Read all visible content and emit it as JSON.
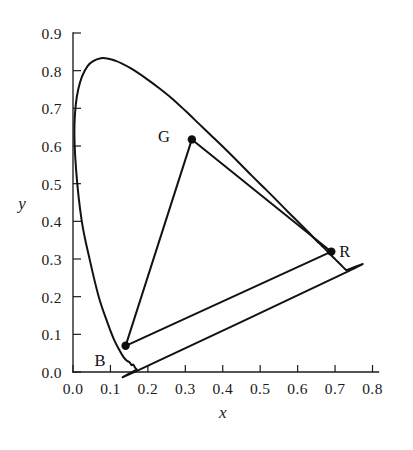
{
  "chart_data": {
    "type": "scatter",
    "title": "",
    "subtitle": "",
    "xlabel": "x",
    "ylabel": "y",
    "xlim": [
      0.0,
      0.8
    ],
    "ylim": [
      0.0,
      0.9
    ],
    "grid": false,
    "legend": "none",
    "x_ticks": [
      "0.0",
      "0.1",
      "0.2",
      "0.3",
      "0.4",
      "0.5",
      "0.6",
      "0.7",
      "0.8"
    ],
    "y_ticks": [
      "0.0",
      "0.1",
      "0.2",
      "0.3",
      "0.4",
      "0.5",
      "0.6",
      "0.7",
      "0.8",
      "0.9"
    ],
    "x_tick_values": [
      0.0,
      0.1,
      0.2,
      0.3,
      0.4,
      0.5,
      0.6,
      0.7,
      0.8
    ],
    "y_tick_values": [
      0.0,
      0.1,
      0.2,
      0.3,
      0.4,
      0.5,
      0.6,
      0.7,
      0.8,
      0.9
    ],
    "series": [
      {
        "name": "spectral-locus",
        "type": "line",
        "closed": true,
        "points": [
          [
            0.175,
            0.005
          ],
          [
            0.17,
            0.007
          ],
          [
            0.1655,
            0.012
          ],
          [
            0.161,
            0.02
          ],
          [
            0.1566,
            0.018
          ],
          [
            0.151,
            0.026
          ],
          [
            0.144,
            0.03
          ],
          [
            0.1355,
            0.039
          ],
          [
            0.1241,
            0.058
          ],
          [
            0.1096,
            0.086
          ],
          [
            0.0913,
            0.133
          ],
          [
            0.0687,
            0.2
          ],
          [
            0.0454,
            0.295
          ],
          [
            0.0235,
            0.4
          ],
          [
            0.0082,
            0.538
          ],
          [
            0.0039,
            0.655
          ],
          [
            0.0139,
            0.75
          ],
          [
            0.0389,
            0.812
          ],
          [
            0.0743,
            0.833
          ],
          [
            0.1142,
            0.826
          ],
          [
            0.1547,
            0.806
          ],
          [
            0.1929,
            0.781
          ],
          [
            0.2296,
            0.754
          ],
          [
            0.2658,
            0.725
          ],
          [
            0.3016,
            0.692
          ],
          [
            0.3373,
            0.658
          ],
          [
            0.3731,
            0.624
          ],
          [
            0.4087,
            0.59
          ],
          [
            0.4441,
            0.555
          ],
          [
            0.4788,
            0.52
          ],
          [
            0.5125,
            0.487
          ],
          [
            0.5448,
            0.455
          ],
          [
            0.5752,
            0.424
          ],
          [
            0.6029,
            0.397
          ],
          [
            0.627,
            0.373
          ],
          [
            0.6482,
            0.351
          ],
          [
            0.6658,
            0.334
          ],
          [
            0.6801,
            0.32
          ],
          [
            0.6915,
            0.308
          ],
          [
            0.7006,
            0.299
          ],
          [
            0.7079,
            0.292
          ],
          [
            0.714,
            0.286
          ],
          [
            0.719,
            0.281
          ],
          [
            0.723,
            0.277
          ],
          [
            0.726,
            0.274
          ],
          [
            0.7283,
            0.272
          ],
          [
            0.73,
            0.27
          ],
          [
            0.7334,
            0.2666
          ]
        ]
      },
      {
        "name": "srgb-gamut-triangle",
        "type": "polygon",
        "closed": true,
        "points": [
          [
            0.69,
            0.3195
          ],
          [
            0.3175,
            0.6175
          ],
          [
            0.1405,
            0.0695
          ]
        ]
      }
    ],
    "annotated_points": [
      {
        "label": "R",
        "x": 0.69,
        "y": 0.3195,
        "label_dx": 8,
        "label_dy": 5
      },
      {
        "label": "G",
        "x": 0.3175,
        "y": 0.6175,
        "label_dx": -22,
        "label_dy": 3
      },
      {
        "label": "B",
        "x": 0.1405,
        "y": 0.0695,
        "label_dx": -20,
        "label_dy": 20
      }
    ]
  },
  "axes": {
    "x_title": "x",
    "y_title": "y"
  }
}
